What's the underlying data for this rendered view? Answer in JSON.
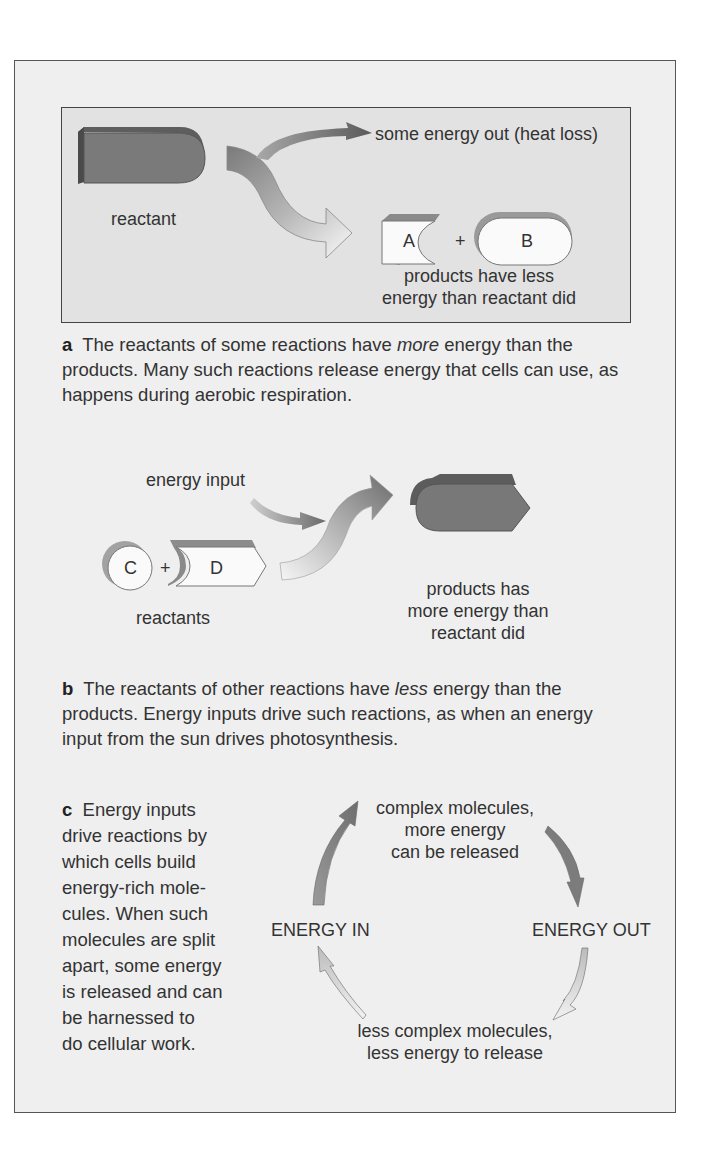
{
  "panel_a": {
    "reactant_label": "reactant",
    "heat_label": "some energy out (heat loss)",
    "product_a": "A",
    "plus": "+",
    "product_b": "B",
    "products_line1": "products have less",
    "products_line2": "energy than reactant did",
    "caption_letter": "a",
    "caption_pre": "The reactants of some reactions have ",
    "caption_em": "more",
    "caption_post": " energy than the products. Many such reactions release energy that cells can use, as happens during aerobic respiration."
  },
  "panel_b": {
    "energy_input_label": "energy input",
    "reactant_c": "C",
    "plus": "+",
    "reactant_d": "D",
    "reactants_label": "reactants",
    "products_line1": "products has",
    "products_line2": "more energy than",
    "products_line3": "reactant did",
    "caption_letter": "b",
    "caption_pre": "The reactants of other reactions have ",
    "caption_em": "less",
    "caption_post": " energy than the products. Energy inputs drive such reactions, as when an energy input from the sun drives photosynthesis."
  },
  "panel_c": {
    "caption_letter": "c",
    "caption_text": "Energy inputs drive reactions by which cells build energy-rich mole-cules. When such molecules are split apart, some energy is released and can be harnessed to do cellular work.",
    "caption_lines": [
      "Energy inputs",
      "drive reactions by",
      "which cells build",
      "energy-rich mole-",
      "cules. When such",
      "molecules are split",
      "apart, some energy",
      "is released and can",
      "be harnessed to",
      "do cellular work."
    ],
    "top_line1": "complex molecules,",
    "top_line2": "more energy",
    "top_line3": "can be released",
    "energy_in": "ENERGY IN",
    "energy_out": "ENERGY OUT",
    "bottom_line1": "less complex molecules,",
    "bottom_line2": "less energy to release"
  },
  "colors": {
    "outer_bg": "#efefef",
    "inner_bg": "#e2e2e2",
    "dark_shape": "#777777",
    "light_shape": "#fafafa"
  }
}
